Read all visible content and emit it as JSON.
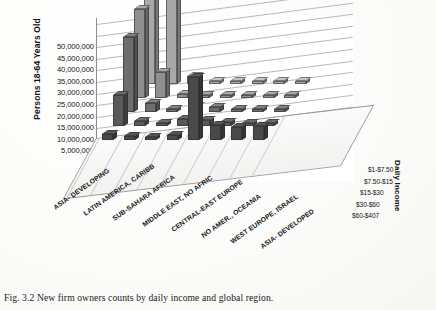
{
  "caption": "Fig. 3.2  New firm owners counts by daily income and global region.",
  "chart_data": {
    "type": "bar",
    "subtype": "3d-column",
    "title": "",
    "xlabel": "",
    "ylabel": "Persons 18-64 Years Old",
    "zlabel": "Daily Income",
    "ylim": [
      0,
      50000000
    ],
    "ytick_values": [
      0,
      5000000,
      10000000,
      15000000,
      20000000,
      25000000,
      30000000,
      35000000,
      40000000,
      45000000,
      50000000
    ],
    "ytick_labels": [
      "0",
      "5,000,000",
      "10,000,000",
      "15,000,000",
      "20,000,000",
      "25,000,000",
      "30,000,000",
      "35,000,000",
      "40,000,000",
      "45,000,000",
      "50,000,000"
    ],
    "grid": true,
    "legend_position": "right-depth-axis",
    "categories": [
      "ASIA- DEVELOPING",
      "LATIN AMERICA, CARIBB",
      "SUB-SAHARA AFRICA",
      "MIDDLE EAST, NO AFRIC",
      "CENTRAL-EAST EUROPE",
      "NO AMER., OCEANIA",
      "WEST EUROPE, ISRAEL",
      "ASIA- DEVELOPED"
    ],
    "series": [
      {
        "name": "$1-$7.50",
        "color": "#a8a8a8",
        "values": [
          40000000,
          53000000,
          3500000,
          1200000,
          300000,
          200000,
          150000,
          120000
        ]
      },
      {
        "name": "$7.50-$15",
        "color": "#8f8f8f",
        "values": [
          38500000,
          11000000,
          1800000,
          900000,
          1500000,
          500000,
          400000,
          300000
        ]
      },
      {
        "name": "$15-$30",
        "color": "#6e6e6e",
        "values": [
          32500000,
          4000000,
          1400000,
          2600000,
          2200000,
          1100000,
          900000,
          700000
        ]
      },
      {
        "name": "$30-$60",
        "color": "#5a5a5a",
        "values": [
          13500000,
          2000000,
          1000000,
          3000000,
          2800000,
          1600000,
          1400000,
          1200000
        ]
      },
      {
        "name": "$60-$407",
        "color": "#4a4a4a",
        "values": [
          2500000,
          1700000,
          900000,
          2200000,
          27000000,
          6500000,
          5500000,
          6000000
        ]
      }
    ]
  }
}
